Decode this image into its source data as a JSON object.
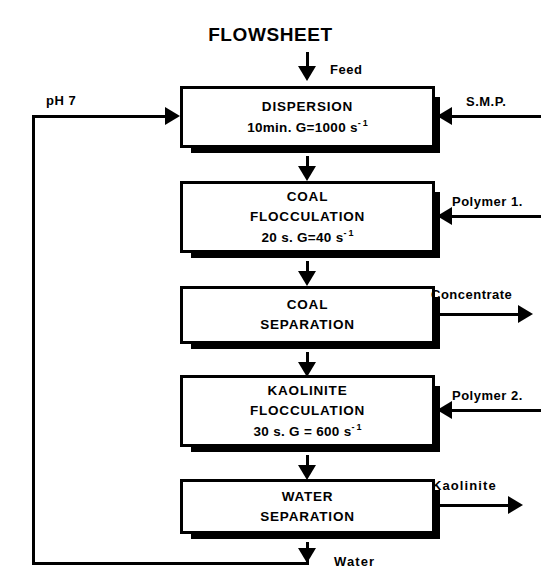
{
  "diagram": {
    "title": "FLOWSHEET",
    "boxes": [
      {
        "id": "dispersion",
        "line1": "DISPERSION",
        "line2_pre": "10min.   G=1000   s",
        "line2_sup_minus": "-",
        "line2_sup_one": "1"
      },
      {
        "id": "coal-flocculation",
        "line1": "COAL",
        "line2": "FLOCCULATION",
        "line3_pre": "20 s.  G=40  s",
        "line3_sup_minus": "-",
        "line3_sup_one": "1"
      },
      {
        "id": "coal-separation",
        "line1": "COAL",
        "line2": "SEPARATION"
      },
      {
        "id": "kaolinite-flocculation",
        "line1": "KAOLINITE",
        "line2": "FLOCCULATION",
        "line3_pre": "30 s.  G = 600  s",
        "line3_sup_minus": "-",
        "line3_sup_one": "1"
      },
      {
        "id": "water-separation",
        "line1": "WATER",
        "line2": "SEPARATION"
      }
    ],
    "streams": {
      "feed": "Feed",
      "smp": "S.M.P.",
      "polymer1": "Polymer  1.",
      "concentrate": "Concentrate",
      "polymer2": "Polymer  2.",
      "kaolinite": "Kaolinite",
      "water": "Water",
      "ph": "pH 7"
    },
    "colors": {
      "stroke": "#000000",
      "fill": "#ffffff",
      "shadow": "#000000"
    }
  }
}
